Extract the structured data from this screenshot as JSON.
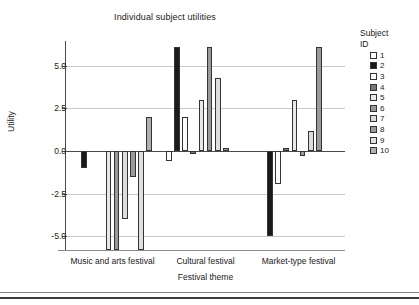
{
  "chart_data": {
    "type": "bar",
    "title": "Individual subject utilities",
    "xlabel": "Festival theme",
    "ylabel": "Utility",
    "categories": [
      "Music and arts festival",
      "Cultural festival",
      "Market-type festival"
    ],
    "ylim": [
      -5.8,
      6.4
    ],
    "yticks": [
      5.0,
      2.5,
      0.0,
      -2.5,
      -5.0
    ],
    "ytick_labels": [
      "5.0",
      "2.5",
      "0.0",
      "-2.5",
      "-5.0"
    ],
    "grid": true,
    "legend_position": "right",
    "legend_title_line1": "Subject",
    "legend_title_line2": "ID",
    "series": [
      {
        "name": "1",
        "color": "#ffffff",
        "values": [
          0.0,
          -0.6,
          0.0
        ]
      },
      {
        "name": "2",
        "color": "#1a1a1a",
        "values": [
          -1.0,
          6.1,
          -5.0
        ]
      },
      {
        "name": "3",
        "color": "#ffffff",
        "values": [
          0.0,
          2.0,
          -1.9
        ]
      },
      {
        "name": "4",
        "color": "#777777",
        "values": [
          0.0,
          -0.15,
          0.2
        ]
      },
      {
        "name": "5",
        "color": "#e8e8e8",
        "values": [
          -5.8,
          3.0,
          3.0
        ]
      },
      {
        "name": "6",
        "color": "#9a9a9a",
        "values": [
          -5.8,
          6.1,
          -0.3
        ]
      },
      {
        "name": "7",
        "color": "#dcdcdc",
        "values": [
          -4.0,
          4.3,
          1.2
        ]
      },
      {
        "name": "8",
        "color": "#9a9a9a",
        "values": [
          -1.5,
          0.2,
          6.1
        ]
      },
      {
        "name": "9",
        "color": "#e0e0e0",
        "values": [
          -5.8,
          0.0,
          0.0
        ]
      },
      {
        "name": "10",
        "color": "#b0b0b0",
        "values": [
          2.0,
          0.0,
          0.0
        ]
      }
    ]
  }
}
